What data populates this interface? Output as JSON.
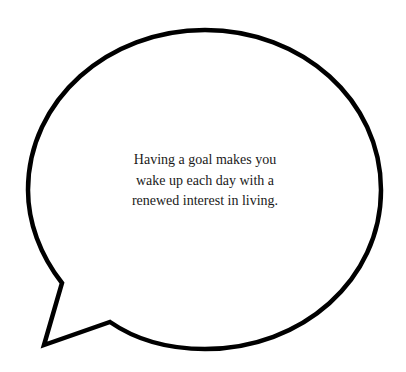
{
  "speech_bubble": {
    "text": "Having a goal makes you wake up each day with a renewed interest in living.",
    "stroke_color": "#000000",
    "fill_color": "#ffffff"
  }
}
